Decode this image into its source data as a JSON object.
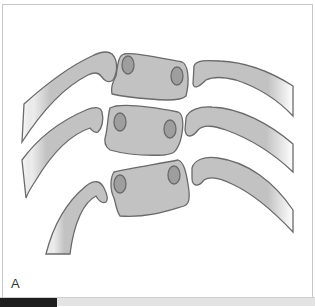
{
  "figure": {
    "panel_label": "A",
    "colors": {
      "bone_fill": "#c2c2c2",
      "bone_stroke": "#6a6a6a",
      "facet_fill": "#9e9e9e",
      "frame_border": "#c6c6c6",
      "bar_dark": "#1e1e1e",
      "bar_light": "#e3e3e3"
    },
    "vertebrae_count": 3,
    "ribs_per_side": 3
  }
}
